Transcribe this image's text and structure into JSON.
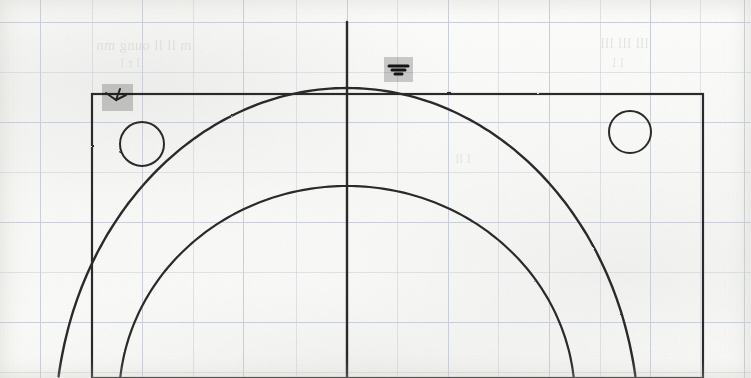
{
  "document": {
    "kind": "scanned-technical-drawing",
    "medium": "graph paper",
    "width": 751,
    "height": 378,
    "background_color": "#fbfbfa",
    "ink_color": "#2a2a2a",
    "grid_color": "#c9cfd6",
    "highlight_color": "#a6a6a6"
  },
  "grid": {
    "spacing_px": 50,
    "vertical_positions": [
      40,
      92,
      142,
      193,
      243,
      296,
      347,
      397,
      448,
      498,
      549,
      600,
      650,
      700,
      744
    ],
    "horizontal_positions": [
      22,
      72,
      122,
      172,
      222,
      272,
      322,
      372
    ]
  },
  "ghost_text": [
    {
      "text": "m  ll ll  oung  mn",
      "x": 96,
      "y": 38,
      "size": 14
    },
    {
      "text": "l r   l",
      "x": 120,
      "y": 56,
      "size": 12
    },
    {
      "text": "lll  lll  lll",
      "x": 600,
      "y": 36,
      "size": 14
    },
    {
      "text": "l l",
      "x": 612,
      "y": 56,
      "size": 12
    },
    {
      "text": "l ll",
      "x": 455,
      "y": 152,
      "size": 12
    }
  ],
  "shapes": {
    "rectangle": {
      "label": "Outer rectangular outline",
      "x": 92,
      "y": 94,
      "width": 611,
      "height": 284,
      "stroke": "#2a2a2a",
      "stroke_width": 2.2
    },
    "centerline": {
      "label": "Vertical centerline",
      "x": 347,
      "y_start": 22,
      "y_end": 378,
      "stroke": "#2a2a2a",
      "stroke_width": 2.4
    },
    "circles": [
      {
        "label": "Left bolt hole",
        "cx": 142,
        "cy": 144,
        "r": 22,
        "stroke": "#2a2a2a",
        "stroke_width": 2.0
      },
      {
        "label": "Right bolt hole",
        "cx": 630,
        "cy": 132,
        "r": 21,
        "stroke": "#2a2a2a",
        "stroke_width": 2.0
      }
    ],
    "arcs": [
      {
        "label": "Outer arc",
        "cx": 347,
        "cy": 430,
        "rx": 292,
        "ry": 342,
        "stroke": "#2a2a2a",
        "stroke_width": 2.4,
        "apex_x": 347,
        "apex_y": 88,
        "left_end_x": 58,
        "left_end_y": 378,
        "right_end_x": 700,
        "right_end_y": 378
      },
      {
        "label": "Inner arc",
        "cx": 347,
        "cy": 400,
        "rx": 228,
        "ry": 214,
        "stroke": "#2a2a2a",
        "stroke_width": 2.2,
        "apex_x": 347,
        "apex_y": 186,
        "left_end_x": 122,
        "left_end_y": 378,
        "right_end_x": 578,
        "right_end_y": 378
      }
    ]
  },
  "annotations": [
    {
      "name": "left-highlight",
      "label": "Gray highlight over left corner callout",
      "x": 102,
      "y": 84,
      "width": 31,
      "height": 27,
      "mark": "arrow-tick",
      "mark_color": "#232323"
    },
    {
      "name": "top-highlight",
      "label": "Gray highlight over top centerline callout",
      "x": 384,
      "y": 57,
      "width": 29,
      "height": 25,
      "mark": "double-chevron",
      "mark_color": "#141414"
    }
  ]
}
